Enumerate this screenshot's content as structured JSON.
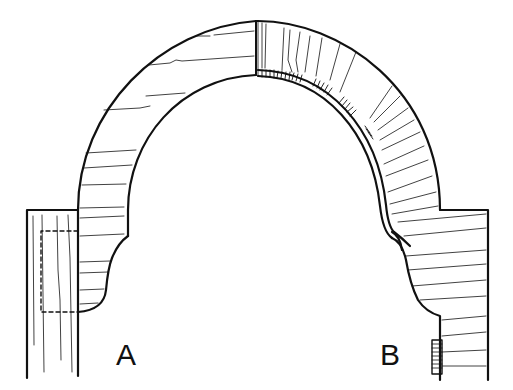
{
  "figure": {
    "type": "architectural-section-drawing",
    "labels": {
      "left": "A",
      "right": "B"
    },
    "colors": {
      "stroke": "#111111",
      "background": "#ffffff"
    }
  }
}
